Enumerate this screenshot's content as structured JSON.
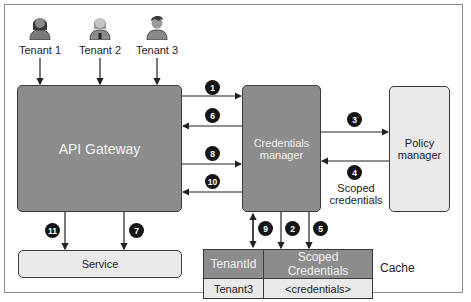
{
  "tenants": [
    {
      "label": "Tenant 1",
      "icon": "person-female-icon"
    },
    {
      "label": "Tenant 2",
      "icon": "person-female-icon"
    },
    {
      "label": "Tenant 3",
      "icon": "person-male-icon"
    }
  ],
  "nodes": {
    "api_gateway": "API Gateway",
    "credentials_manager_line1": "Credentials",
    "credentials_manager_line2": "manager",
    "policy_manager_line1": "Policy",
    "policy_manager_line2": "manager",
    "service": "Service"
  },
  "steps": [
    "1",
    "2",
    "3",
    "4",
    "5",
    "6",
    "7",
    "8",
    "9",
    "10",
    "11"
  ],
  "labels": {
    "scoped_line1": "Scoped",
    "scoped_line2": "credentials",
    "cache": "Cache"
  },
  "cache_table": {
    "headers": [
      "TenantId",
      "Scoped Credentials"
    ],
    "rows": [
      [
        "Tenant3",
        "<credentials>"
      ]
    ]
  },
  "colors": {
    "dark_box": "#8c8c8c",
    "light_box": "#e9e9e9",
    "badge": "#151515"
  }
}
